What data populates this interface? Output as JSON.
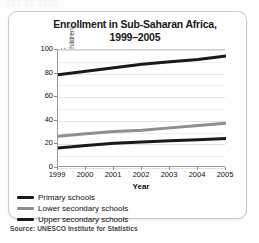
{
  "top_strip": {
    "ghost_text": "░░░ ░░ ░░░░"
  },
  "chart_data": {
    "type": "line",
    "title": "Enrollment in Sub-Saharan Africa, 1999–2005",
    "title_line1": "Enrollment in Sub-Saharan Africa,",
    "title_line2": "1999–2005",
    "xlabel": "Year",
    "ylabel": "School enrollment",
    "ylabel_sub": "(in percentage of school-age children)",
    "categories": [
      "1999",
      "2000",
      "2001",
      "2002",
      "2003",
      "2004",
      "2005"
    ],
    "x": [
      1999,
      2000,
      2001,
      2002,
      2003,
      2004,
      2005
    ],
    "xlim": [
      1999,
      2005
    ],
    "ylim": [
      0,
      100
    ],
    "yticks": [
      0,
      20,
      40,
      60,
      80,
      100
    ],
    "ytick_labels": [
      "0",
      "20",
      "40",
      "60",
      "80",
      "100"
    ],
    "grid": true,
    "legend_position": "below-left",
    "series": [
      {
        "name": "Primary schools",
        "color": "#1a1a1a",
        "values": [
          79,
          82,
          85,
          88,
          90,
          92,
          95
        ]
      },
      {
        "name": "Lower secondary schools",
        "color": "#8e8e8e",
        "values": [
          27,
          29,
          31,
          32,
          34,
          36,
          38
        ]
      },
      {
        "name": "Upper secondary schools",
        "color": "#1a1a1a",
        "values": [
          17,
          19,
          21,
          22,
          23,
          24,
          25
        ]
      }
    ],
    "source": "Source: UNESCO Institute for Statistics"
  }
}
